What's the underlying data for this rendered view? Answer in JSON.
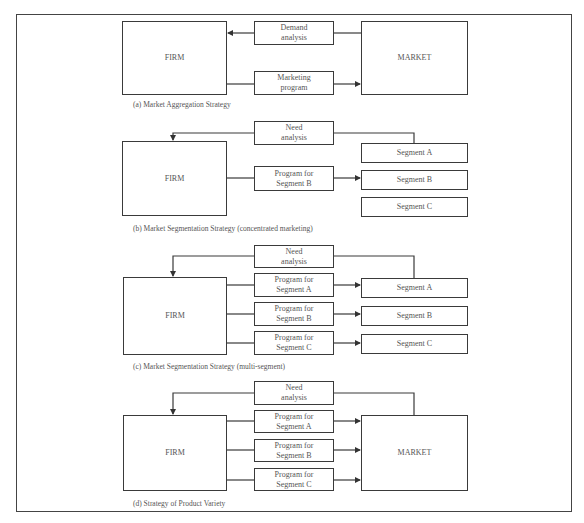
{
  "diagram_a": {
    "firm": "FIRM",
    "market": "MARKET",
    "demand_analysis": "Demand\nanalysis",
    "marketing_program": "Marketing\nprogram",
    "caption": "(a) Market Aggregation Strategy"
  },
  "diagram_b": {
    "firm": "FIRM",
    "need_analysis": "Need\nanalysis",
    "program_b": "Program for\nSegment B",
    "segment_a": "Segment A",
    "segment_b": "Segment B",
    "segment_c": "Segment C",
    "caption": "(b) Market Segmentation Strategy (concentrated marketing)"
  },
  "diagram_c": {
    "firm": "FIRM",
    "need_analysis": "Need\nanalysis",
    "program_a": "Program for\nSegment A",
    "program_b": "Program for\nSegment B",
    "program_c": "Program for\nSegment C",
    "segment_a": "Segment A",
    "segment_b": "Segment B",
    "segment_c": "Segment C",
    "caption": "(c) Market Segmentation Strategy (multi-segment)"
  },
  "diagram_d": {
    "firm": "FIRM",
    "market": "MARKET",
    "need_analysis": "Need\nanalysis",
    "program_a": "Program for\nSegment A",
    "program_b": "Program for\nSegment B",
    "program_c": "Program for\nSegment C",
    "caption": "(d) Strategy of Product Variety"
  },
  "colors": {
    "line": "#3a3a3a",
    "text": "#555555",
    "background": "#ffffff"
  }
}
